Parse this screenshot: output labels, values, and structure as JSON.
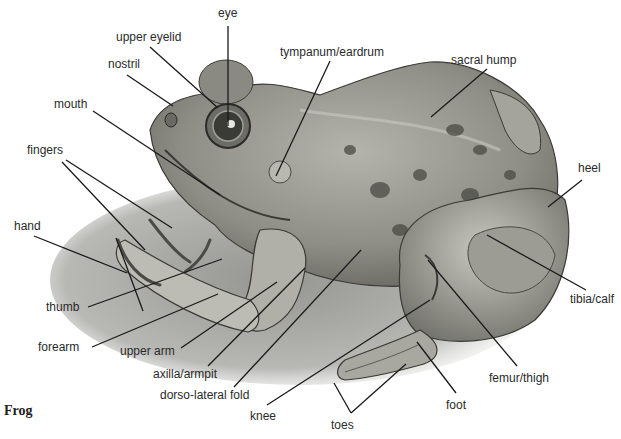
{
  "title": "Frog",
  "labels": {
    "eye": "eye",
    "upper_eyelid": "upper eyelid",
    "nostril": "nostril",
    "mouth": "mouth",
    "fingers": "fingers",
    "hand": "hand",
    "thumb": "thumb",
    "forearm": "forearm",
    "upper_arm": "upper arm",
    "axilla": "axilla/armpit",
    "dorso_lateral_fold": "dorso-lateral fold",
    "knee": "knee",
    "toes": "toes",
    "foot": "foot",
    "femur": "femur/thigh",
    "tibia": "tibia/calf",
    "heel": "heel",
    "sacral_hump": "sacral hump",
    "tympanum": "tympanum/eardrum"
  },
  "colors": {
    "ink": "#222222",
    "skin_dark": "#5a5a52",
    "skin_mid": "#8c8c84",
    "skin_light": "#c4c4bc",
    "shadow": "#a8a8a4"
  }
}
